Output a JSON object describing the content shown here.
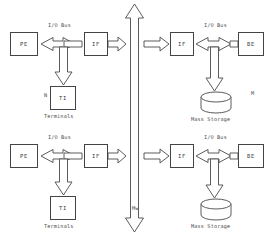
{
  "diagram": {
    "canvas": {
      "width": 277,
      "height": 236
    },
    "colors": {
      "stroke": "#4a4a4a",
      "box_border": "#444444",
      "text": "#3a3a3a",
      "background": "#ffffff"
    },
    "nodes": [
      {
        "id": "pe_top",
        "label": "PE",
        "x": 10,
        "y": 32,
        "w": 28,
        "h": 24
      },
      {
        "id": "if_top_left",
        "label": "IF",
        "x": 84,
        "y": 32,
        "w": 24,
        "h": 24
      },
      {
        "id": "if_top_right",
        "label": "IF",
        "x": 170,
        "y": 32,
        "w": 24,
        "h": 24
      },
      {
        "id": "be_top",
        "label": "BE",
        "x": 238,
        "y": 32,
        "w": 26,
        "h": 24
      },
      {
        "id": "ti_top",
        "label": "TI",
        "x": 50,
        "y": 86,
        "w": 26,
        "h": 24
      },
      {
        "id": "pe_bottom",
        "label": "PE",
        "x": 10,
        "y": 144,
        "w": 28,
        "h": 24
      },
      {
        "id": "if_bottom_left",
        "label": "IF",
        "x": 84,
        "y": 144,
        "w": 24,
        "h": 24
      },
      {
        "id": "if_bottom_right",
        "label": "IF",
        "x": 170,
        "y": 144,
        "w": 24,
        "h": 24
      },
      {
        "id": "be_bottom",
        "label": "BE",
        "x": 238,
        "y": 144,
        "w": 26,
        "h": 24
      },
      {
        "id": "ti_bottom",
        "label": "TI",
        "x": 50,
        "y": 196,
        "w": 26,
        "h": 24
      }
    ],
    "storage": [
      {
        "id": "mass_storage_top",
        "label": "Mass Storage",
        "cx": 216,
        "cy": 97,
        "rx": 15,
        "ry": 5,
        "h": 16
      },
      {
        "id": "mass_storage_bottom",
        "label": "Mass Storage",
        "cx": 216,
        "cy": 204,
        "rx": 15,
        "ry": 5,
        "h": 16
      }
    ],
    "bus_labels": [
      {
        "id": "io_bus_top_left",
        "text": "I/O Bus",
        "x": 48,
        "y": 22
      },
      {
        "id": "io_bus_top_right",
        "text": "I/O Bus",
        "x": 204,
        "y": 22
      },
      {
        "id": "io_bus_bottom_left",
        "text": "I/O Bus",
        "x": 48,
        "y": 134
      },
      {
        "id": "io_bus_bottom_right",
        "text": "I/O Bus",
        "x": 204,
        "y": 134
      }
    ],
    "captions": [
      {
        "id": "terminals_top",
        "text": "Terminals",
        "x": 44,
        "y": 113
      },
      {
        "id": "terminals_bottom",
        "text": "Terminals",
        "x": 44,
        "y": 223
      },
      {
        "id": "mass_storage_top_cap",
        "text": "Mass Storage",
        "x": 191,
        "y": 116
      },
      {
        "id": "mass_storage_bot_cap",
        "text": "Mass Storage",
        "x": 191,
        "y": 223
      },
      {
        "id": "memory_bus_label",
        "text": "Mw",
        "x": 132,
        "y": 205
      }
    ],
    "markers": [
      {
        "id": "marker_n",
        "text": "N",
        "x": 44,
        "y": 92
      },
      {
        "id": "marker_m",
        "text": "M",
        "x": 251,
        "y": 90
      }
    ]
  }
}
